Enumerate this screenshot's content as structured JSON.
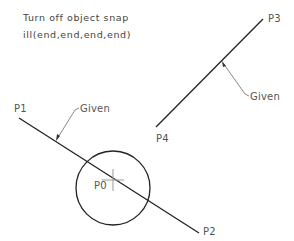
{
  "instructions": {
    "line1": "Turn off object snap",
    "line2": "ill(end,end,end,end)"
  },
  "points": {
    "p0": "P0",
    "p1": "P1",
    "p2": "P2",
    "p3": "P3",
    "p4": "P4"
  },
  "leaders": {
    "given_1": "Given",
    "given_2": "Given"
  },
  "colors": {
    "geometry": "#222222",
    "leader": "#888888",
    "text": "#555555"
  }
}
